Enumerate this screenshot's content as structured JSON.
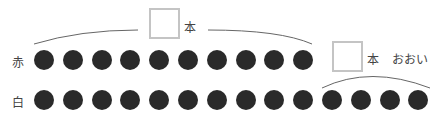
{
  "rows": [
    {
      "label": "赤",
      "count": 10
    },
    {
      "label": "白",
      "count": 14
    }
  ],
  "answer_box_1": {
    "unit": "本"
  },
  "answer_box_2": {
    "unit": "本",
    "note": "おおい"
  },
  "colors": {
    "dot": "#2a2a2a",
    "box_border": "#c4c4c4",
    "arc": "#555555"
  }
}
